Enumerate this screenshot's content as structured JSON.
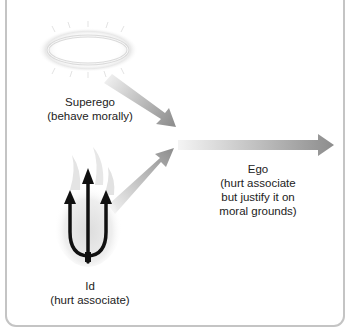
{
  "diagram": {
    "nodes": {
      "superego": {
        "title": "Superego",
        "desc": "(behave morally)",
        "icon": "halo-icon"
      },
      "id": {
        "title": "Id",
        "desc": "(hurt associate)",
        "icon": "trident-flame-icon"
      },
      "ego": {
        "title": "Ego",
        "desc_lines": [
          "(hurt associate",
          "but justify it on",
          "moral grounds)"
        ]
      }
    },
    "arrows": [
      {
        "from": "superego",
        "to": "junction"
      },
      {
        "from": "id",
        "to": "junction"
      },
      {
        "from": "junction",
        "to": "ego-output"
      }
    ],
    "colors": {
      "arrow_dark": "#8c8c8c",
      "arrow_light": "#efefef",
      "border": "#c4c4c4",
      "text": "#222222"
    }
  }
}
